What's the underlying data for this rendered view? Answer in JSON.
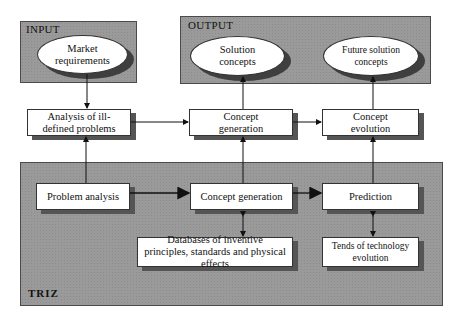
{
  "panels": {
    "input": {
      "label": "INPUT"
    },
    "output": {
      "label": "OUTPUT"
    },
    "triz": {
      "label": "TRIZ"
    }
  },
  "ellipses": {
    "market_requirements": "Market requirements",
    "solution_concepts": "Solution concepts",
    "future_solution_concepts": "Future solution concepts"
  },
  "boxes": {
    "analysis_ill_defined": "Analysis of ill-defined problems",
    "concept_generation_top": "Concept generation",
    "concept_evolution": "Concept evolution",
    "problem_analysis": "Problem analysis",
    "concept_generation_triz": "Concept generation",
    "prediction": "Prediction",
    "databases": "Databases of inventive principles, standards and physical effects",
    "trends": "Tends of technology evolution"
  },
  "colors": {
    "panel_fill": "#9a9a9a",
    "shadow": "#555555",
    "line": "#111111"
  }
}
